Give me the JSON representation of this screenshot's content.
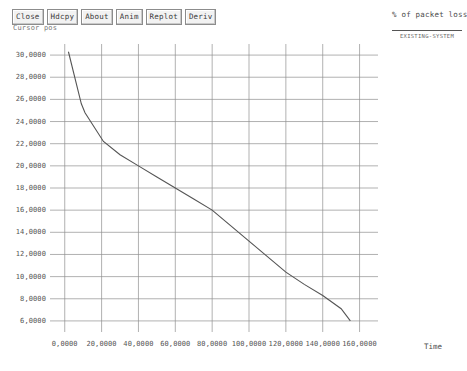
{
  "toolbar": {
    "buttons": [
      {
        "label": "Close",
        "name": "close-button"
      },
      {
        "label": "Hdcpy",
        "name": "hardcopy-button"
      },
      {
        "label": "About",
        "name": "about-button"
      },
      {
        "label": "Anim",
        "name": "animate-button"
      },
      {
        "label": "Replot",
        "name": "replot-button"
      },
      {
        "label": "Deriv",
        "name": "derivative-button"
      }
    ]
  },
  "cursor_readout": "Cursor pos",
  "legend": {
    "entries": [
      {
        "label": "EXISTING-SYSTEM",
        "color": "#555555"
      }
    ]
  },
  "chart_data": {
    "type": "line",
    "title": "% of packet loss",
    "xlabel": "Time",
    "ylabel": "",
    "xlim": [
      -8,
      170
    ],
    "ylim": [
      5,
      31
    ],
    "grid": true,
    "legend_position": "top-right",
    "xticks": [
      0,
      20,
      40,
      60,
      80,
      100,
      120,
      140,
      160
    ],
    "xtick_labels": [
      "0,0000",
      "20,0000",
      "40,0000",
      "60,0000",
      "80,0000",
      "100,0000",
      "120,0000",
      "140,0000",
      "160,0000"
    ],
    "yticks": [
      6,
      8,
      10,
      12,
      14,
      16,
      18,
      20,
      22,
      24,
      26,
      28,
      30
    ],
    "ytick_labels": [
      "6,0000",
      "8,0000",
      "10,0000",
      "12,0000",
      "14,0000",
      "16,0000",
      "18,0000",
      "20,0000",
      "22,0000",
      "24,0000",
      "26,0000",
      "28,0000",
      "30,0000"
    ],
    "series": [
      {
        "name": "EXISTING-SYSTEM",
        "color": "#555555",
        "x": [
          2,
          9,
          11,
          21,
          30,
          40,
          50,
          60,
          70,
          80,
          90,
          100,
          110,
          120,
          130,
          140,
          150,
          155
        ],
        "y": [
          30.3,
          25.6,
          24.8,
          22.2,
          21.0,
          20.0,
          19.0,
          18.0,
          17.0,
          16.0,
          14.6,
          13.2,
          11.8,
          10.4,
          9.3,
          8.3,
          7.1,
          6.0
        ]
      }
    ]
  }
}
